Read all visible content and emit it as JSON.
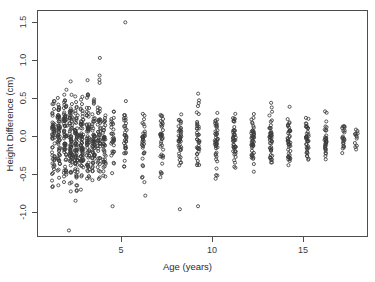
{
  "chart_data": {
    "type": "scatter",
    "title": "",
    "xlabel": "Age (years)",
    "ylabel": "Height Difference (cm)",
    "xlim": [
      0.2,
      18.4
    ],
    "ylim": [
      -1.28,
      1.72
    ],
    "xticks": [
      5,
      10,
      15
    ],
    "xticklabels": [
      "5",
      "10",
      "15"
    ],
    "yticks": [
      1.5,
      1.0,
      0.5,
      0.0,
      -0.5,
      -1.0
    ],
    "yticklabels": [
      "1.5",
      "1.0",
      "0.5",
      "0.0",
      "-0.5",
      "-1.0"
    ],
    "grid": false,
    "legend": null,
    "marker": "open-circle",
    "marker_color": "#3b3b3b",
    "marker_size": 3.1,
    "box": true,
    "series": [
      {
        "name": "Height difference",
        "age_groups": [
          {
            "age": 1.05,
            "n": 52,
            "center": 0.02,
            "spread": 0.3,
            "min": -0.62,
            "max": 0.58
          },
          {
            "age": 1.35,
            "n": 60,
            "center": 0.03,
            "spread": 0.31,
            "min": -0.7,
            "max": 0.72
          },
          {
            "age": 1.7,
            "n": 66,
            "center": 0.02,
            "spread": 0.32,
            "min": -0.78,
            "max": 0.82
          },
          {
            "age": 2.0,
            "n": 72,
            "center": 0.02,
            "spread": 0.31,
            "min": -0.82,
            "max": 0.86
          },
          {
            "age": 2.3,
            "n": 70,
            "center": 0.01,
            "spread": 0.3,
            "min": -0.8,
            "max": 0.8
          },
          {
            "age": 2.62,
            "n": 68,
            "center": 0.02,
            "spread": 0.3,
            "min": -0.74,
            "max": 0.86
          },
          {
            "age": 2.95,
            "n": 62,
            "center": 0.01,
            "spread": 0.29,
            "min": -0.7,
            "max": 0.9
          },
          {
            "age": 3.25,
            "n": 56,
            "center": 0.02,
            "spread": 0.28,
            "min": -0.66,
            "max": 0.88
          },
          {
            "age": 3.55,
            "n": 50,
            "center": 0.01,
            "spread": 0.27,
            "min": -0.6,
            "max": 1.1
          },
          {
            "age": 3.85,
            "n": 42,
            "center": 0.02,
            "spread": 0.26,
            "min": -0.58,
            "max": 0.52
          },
          {
            "age": 4.3,
            "n": 30,
            "center": 0.01,
            "spread": 0.24,
            "min": -0.86,
            "max": 0.48
          },
          {
            "age": 5.0,
            "n": 34,
            "center": 0.02,
            "spread": 0.22,
            "min": -0.5,
            "max": 1.57
          },
          {
            "age": 6.0,
            "n": 33,
            "center": 0.01,
            "spread": 0.21,
            "min": -0.72,
            "max": 0.62
          },
          {
            "age": 7.0,
            "n": 36,
            "center": 0.02,
            "spread": 0.22,
            "min": -0.48,
            "max": 0.46
          },
          {
            "age": 8.0,
            "n": 40,
            "center": 0.01,
            "spread": 0.23,
            "min": -0.9,
            "max": 0.8
          },
          {
            "age": 9.0,
            "n": 38,
            "center": 0.02,
            "spread": 0.21,
            "min": -0.46,
            "max": 0.7
          },
          {
            "age": 10.0,
            "n": 42,
            "center": 0.01,
            "spread": 0.22,
            "min": -0.52,
            "max": 0.56
          },
          {
            "age": 11.0,
            "n": 44,
            "center": 0.02,
            "spread": 0.21,
            "min": -0.54,
            "max": 0.84
          },
          {
            "age": 12.0,
            "n": 46,
            "center": 0.01,
            "spread": 0.2,
            "min": -0.5,
            "max": 0.54
          },
          {
            "age": 13.0,
            "n": 44,
            "center": 0.02,
            "spread": 0.19,
            "min": -0.46,
            "max": 0.52
          },
          {
            "age": 14.0,
            "n": 42,
            "center": 0.01,
            "spread": 0.18,
            "min": -0.44,
            "max": 0.48
          },
          {
            "age": 15.0,
            "n": 38,
            "center": 0.02,
            "spread": 0.17,
            "min": -0.66,
            "max": 0.46
          },
          {
            "age": 16.0,
            "n": 32,
            "center": 0.01,
            "spread": 0.15,
            "min": -0.4,
            "max": 0.44
          },
          {
            "age": 17.0,
            "n": 22,
            "center": 0.02,
            "spread": 0.12,
            "min": -0.28,
            "max": 0.3
          },
          {
            "age": 17.7,
            "n": 12,
            "center": 0.01,
            "spread": 0.08,
            "min": -0.18,
            "max": 0.2
          }
        ],
        "outliers": [
          {
            "age": 5.0,
            "value": 1.57
          },
          {
            "age": 3.6,
            "value": 1.1
          },
          {
            "age": 8.0,
            "value": -0.9
          },
          {
            "age": 4.3,
            "value": -0.86
          },
          {
            "age": 1.9,
            "value": -1.18
          },
          {
            "age": 6.1,
            "value": -0.72
          },
          {
            "age": 9.0,
            "value": -0.86
          }
        ]
      }
    ]
  },
  "axes": {
    "x_title": "Age (years)",
    "y_title": "Height Difference (cm)"
  }
}
